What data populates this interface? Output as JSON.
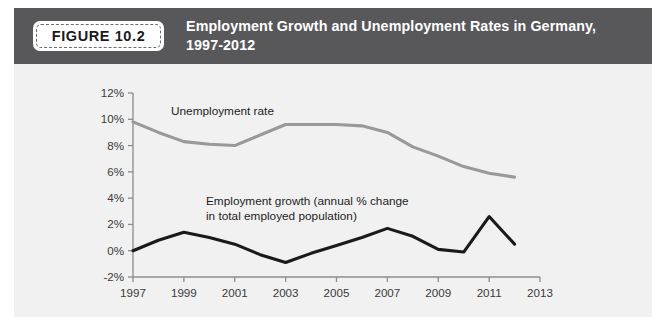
{
  "figure": {
    "badge_label": "FIGURE 10.2",
    "title": "Employment Growth and Unemployment Rates in Germany, 1997-2012",
    "header_color": "#58585a",
    "body_color": "#f1f1f1"
  },
  "chart_data": {
    "type": "line",
    "title": "Employment Growth and Unemployment Rates in Germany, 1997-2012",
    "xlabel": "",
    "ylabel": "",
    "grid": false,
    "legend_position": "inline-annotation",
    "x": [
      1997,
      1998,
      1999,
      2000,
      2001,
      2002,
      2003,
      2004,
      2005,
      2006,
      2007,
      2008,
      2009,
      2010,
      2011,
      2012
    ],
    "xlim": [
      1997,
      2013
    ],
    "ylim": [
      -2,
      12
    ],
    "xticks": [
      1997,
      1999,
      2001,
      2003,
      2005,
      2007,
      2009,
      2011,
      2013
    ],
    "xtick_labels": [
      "1997",
      "1999",
      "2001",
      "2003",
      "2005",
      "2007",
      "2009",
      "2011",
      "2013"
    ],
    "yticks": [
      -2,
      0,
      2,
      4,
      6,
      8,
      10,
      12
    ],
    "ytick_labels": [
      "-2%",
      "0%",
      "2%",
      "4%",
      "6%",
      "8%",
      "10%",
      "12%"
    ],
    "series": [
      {
        "name": "Unemployment rate",
        "annotation": "Unemployment rate",
        "color": "#999999",
        "width": 3.1,
        "values": [
          9.8,
          9.0,
          8.3,
          8.1,
          8.0,
          8.8,
          9.6,
          9.6,
          9.6,
          9.5,
          9.0,
          7.9,
          7.2,
          6.4,
          5.9,
          5.6
        ]
      },
      {
        "name": "Employment growth",
        "annotation": "Employment growth (annual % change in total employed population)",
        "annotation_line1": "Employment growth (annual % change",
        "annotation_line2": "in total employed population)",
        "color": "#1a1a1a",
        "width": 3.1,
        "values": [
          0.0,
          0.8,
          1.4,
          1.0,
          0.5,
          -0.3,
          -0.9,
          -0.2,
          0.4,
          1.0,
          1.7,
          1.1,
          0.1,
          -0.1,
          2.6,
          0.5
        ]
      }
    ],
    "axis_color": "#8c8c8c"
  }
}
